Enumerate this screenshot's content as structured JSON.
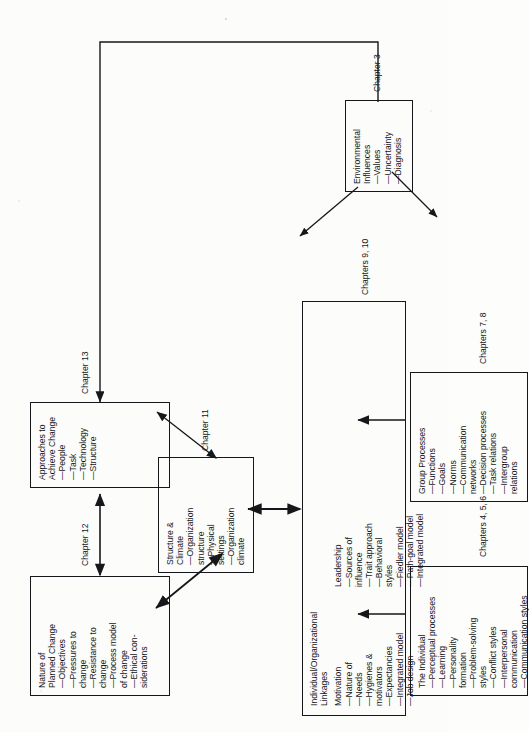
{
  "diagram": {
    "orientation": "rotated-90-ccw",
    "boxes": [
      {
        "id": "nature-of-planned-change",
        "title": "Nature of\nPlanned Change",
        "items": [
          "—Objectives",
          "—Pressures to\n   change",
          "—Resistance to\n   change",
          "—Process model\n   of change",
          "—Ethical con-\n   siderations"
        ],
        "caption": "Chapter 12"
      },
      {
        "id": "approaches-to-achieve-change",
        "title": "Approaches to\nAchieve Change",
        "items": [
          "—People",
          "—Task",
          "—Technology",
          "—Structure"
        ],
        "caption": "Chapter 13"
      },
      {
        "id": "structure-and-climate",
        "title": "Structure &\nClimate",
        "items": [
          "—Organization\n   structure",
          "—Physical\n   settings",
          "—Organization\n   climate"
        ],
        "caption": "Chapter 11"
      },
      {
        "id": "individual-organizational-linkages",
        "title": "Individual/Organizational\nLinkages",
        "subgroups": [
          {
            "heading": "Motivation",
            "items": [
              "—Nature of",
              "—Needs",
              "—Hygienes &\n   motivators",
              "—Expectancies",
              "—Integrated model",
              "—Job design"
            ]
          },
          {
            "heading": "Leadership",
            "items": [
              "—Sources of\n   influence",
              "—Trait approach",
              "—Behavioral\n   styles",
              "—Fiedler model",
              "—Path-goal model",
              "—Integrated model"
            ]
          }
        ],
        "caption": "Chapters 9, 10"
      },
      {
        "id": "the-individual",
        "title": "The Individual",
        "items": [
          "—Perceptual processes",
          "—Learning",
          "—Personality\n   formation",
          "—Problem-solving\n   styles",
          "—Conflict styles",
          "—Interpersonal\n   communication",
          "—Communication styles"
        ],
        "caption": "Chapters 4, 5, 6"
      },
      {
        "id": "group-processes",
        "title": "Group Processes",
        "items": [
          "—Functions",
          "—Goals",
          "—Norms",
          "—Communication\n   networks",
          "—Decision processes",
          "—Task relations",
          "—Intergroup\n   relations"
        ],
        "caption": "Chapters 7, 8"
      },
      {
        "id": "environmental-influences",
        "title": "Environmental\nInfluences",
        "items": [
          "—Values",
          "—Uncertainty",
          "—Diagnosis"
        ],
        "caption": "Chapter 3"
      }
    ],
    "connectors": [
      {
        "from": "nature-of-planned-change",
        "to": "approaches-to-achieve-change",
        "style": "double"
      },
      {
        "from": "nature-of-planned-change",
        "to": "structure-and-climate",
        "style": "double"
      },
      {
        "from": "structure-and-climate",
        "to": "approaches-to-achieve-change",
        "style": "double"
      },
      {
        "from": "individual-organizational-linkages",
        "to": "structure-and-climate",
        "style": "double"
      },
      {
        "from": "the-individual",
        "to": "individual-organizational-linkages",
        "style": "single"
      },
      {
        "from": "group-processes",
        "to": "individual-organizational-linkages",
        "style": "single"
      },
      {
        "from": "environmental-influences",
        "to": "the-individual",
        "style": "single"
      },
      {
        "from": "environmental-influences",
        "to": "group-processes",
        "style": "single"
      },
      {
        "from": "environmental-influences",
        "to": "approaches-to-achieve-change",
        "style": "single"
      }
    ]
  }
}
